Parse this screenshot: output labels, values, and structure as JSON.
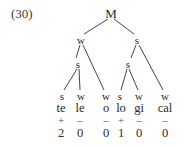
{
  "example_number": "(30)",
  "tree": {
    "root": {
      "label": "M",
      "x": 111,
      "y": 13
    },
    "level1": [
      {
        "label": "w",
        "x": 81,
        "y": 40
      },
      {
        "label": "s",
        "x": 137,
        "y": 40
      }
    ],
    "level2": [
      {
        "label": "s",
        "x": 78,
        "y": 64
      },
      {
        "label": "s",
        "x": 128,
        "y": 64
      }
    ],
    "leaves": [
      {
        "label": "s",
        "x": 62,
        "y": 96
      },
      {
        "label": "w",
        "x": 81,
        "y": 96
      },
      {
        "label": "w",
        "x": 106,
        "y": 96
      },
      {
        "label": "s",
        "x": 120,
        "y": 96
      },
      {
        "label": "w",
        "x": 139,
        "y": 96
      },
      {
        "label": "w",
        "x": 165,
        "y": 96
      }
    ]
  },
  "columns": [
    {
      "syllable": "te",
      "stress": "+",
      "value": "2"
    },
    {
      "syllable": "le",
      "stress": "–",
      "value": "0"
    },
    {
      "syllable": "o",
      "stress": "–",
      "value": "0"
    },
    {
      "syllable": "lo",
      "stress": "+",
      "value": "1"
    },
    {
      "syllable": "gi",
      "stress": "–",
      "value": "0"
    },
    {
      "syllable": "cal",
      "stress": "–",
      "value": "0"
    }
  ]
}
